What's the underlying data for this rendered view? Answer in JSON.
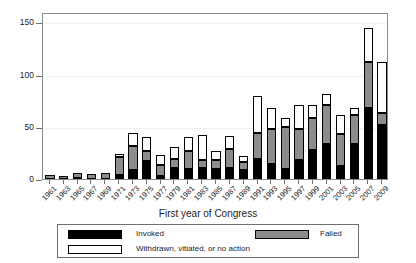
{
  "chart_data": {
    "type": "bar",
    "title": "",
    "subtitle": "",
    "xlabel": "First year of Congress",
    "ylabel": "",
    "stacked": true,
    "grid": true,
    "legend_position": "bottom",
    "ylim": [
      0,
      160
    ],
    "yticks": [
      0,
      50,
      100,
      150
    ],
    "ytick_labels": [
      "0",
      "50",
      "100",
      "150"
    ],
    "categories": [
      "1961",
      "1963",
      "1965",
      "1967",
      "1969",
      "1971",
      "1973",
      "1975",
      "1977",
      "1979",
      "1981",
      "1983",
      "1985",
      "1987",
      "1989",
      "1991",
      "1993",
      "1995",
      "1997",
      "1999",
      "2001",
      "2003",
      "2005",
      "2007",
      "2009"
    ],
    "series": [
      {
        "name": "Invoked",
        "color": "#000000",
        "values": [
          0,
          0,
          1,
          0,
          0,
          4,
          9,
          17,
          3,
          11,
          10,
          11,
          10,
          11,
          9,
          19,
          14,
          10,
          18,
          28,
          34,
          12,
          34,
          68,
          52
        ]
      },
      {
        "name": "Failed",
        "color": "#8c8c8c",
        "values": [
          4,
          3,
          5,
          5,
          6,
          17,
          23,
          10,
          10,
          8,
          17,
          7,
          8,
          18,
          7,
          25,
          34,
          40,
          30,
          30,
          37,
          31,
          27,
          44,
          11
        ]
      },
      {
        "name": "Withdrawn, vitiated, or no action",
        "color": "#ffffff",
        "values": [
          0,
          0,
          0,
          0,
          0,
          3,
          12,
          13,
          10,
          12,
          13,
          24,
          9,
          12,
          6,
          36,
          20,
          8,
          23,
          13,
          10,
          18,
          7,
          33,
          49
        ]
      }
    ],
    "totals": [
      4,
      3,
      6,
      5,
      6,
      24,
      44,
      40,
      23,
      31,
      40,
      42,
      27,
      41,
      22,
      80,
      68,
      58,
      71,
      71,
      81,
      61,
      68,
      145,
      112
    ]
  },
  "legend": {
    "entries": [
      {
        "label": "Invoked",
        "swatch": "black"
      },
      {
        "label": "Failed",
        "swatch": "gray"
      },
      {
        "label": "Withdrawn, vitiated, or no action",
        "swatch": "white"
      }
    ]
  }
}
